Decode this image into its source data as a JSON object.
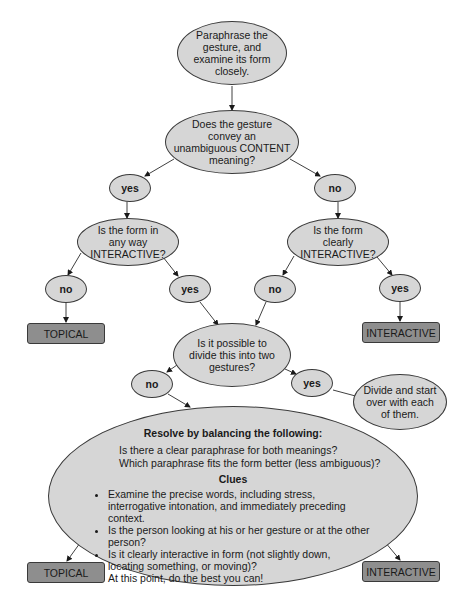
{
  "diagram": {
    "type": "decision-flowchart",
    "colors": {
      "ellipse_fill": "#d6d6d6",
      "outcome_fill": "#8e8e8e",
      "stroke": "#3a3a3a",
      "background": "#ffffff"
    },
    "nodes": {
      "start": {
        "lines": [
          "Paraphrase the",
          "gesture, and",
          "examine its form",
          "closely."
        ]
      },
      "q_content": {
        "lines": [
          "Does the gesture",
          "convey an",
          "unambiguous CONTENT",
          "meaning?"
        ]
      },
      "ans_yes_1": {
        "label": "yes"
      },
      "ans_no_1": {
        "label": "no"
      },
      "q_any_interactive": {
        "lines": [
          "Is the form in",
          "any way",
          "INTERACTIVE?"
        ]
      },
      "q_clearly_interactive": {
        "lines": [
          "Is the form",
          "clearly",
          "INTERACTIVE?"
        ]
      },
      "ans_no_2": {
        "label": "no"
      },
      "ans_yes_2": {
        "label": "yes"
      },
      "ans_no_3": {
        "label": "no"
      },
      "ans_yes_3": {
        "label": "yes"
      },
      "outcome_topical_1": {
        "label": "TOPICAL"
      },
      "outcome_interactive_1": {
        "label": "INTERACTIVE"
      },
      "q_divide": {
        "lines": [
          "Is it possible to",
          "divide this into two",
          "gestures?"
        ]
      },
      "ans_no_4": {
        "label": "no"
      },
      "ans_yes_4": {
        "label": "yes"
      },
      "divide_action": {
        "lines": [
          "Divide and start",
          "over with each",
          "of them."
        ]
      },
      "resolve": {
        "title": "Resolve by balancing the following:",
        "questions": [
          "Is there a clear paraphrase for both meanings?",
          "Which paraphrase fits the form better (less ambiguous)?"
        ],
        "clues_title": "Clues",
        "clues": [
          "Examine the precise words, including stress, interrogative intonation, and immediately preceding context.",
          "Is the person looking at his or her gesture or at the other person?",
          "Is it clearly interactive in form (not slightly down, locating something, or moving)?",
          "At this point, do the best you can!"
        ]
      },
      "outcome_topical_2": {
        "label": "TOPICAL"
      },
      "outcome_interactive_2": {
        "label": "INTERACTIVE"
      }
    },
    "edges": [
      [
        "start",
        "q_content"
      ],
      [
        "q_content",
        "ans_yes_1"
      ],
      [
        "q_content",
        "ans_no_1"
      ],
      [
        "ans_yes_1",
        "q_any_interactive"
      ],
      [
        "ans_no_1",
        "q_clearly_interactive"
      ],
      [
        "q_any_interactive",
        "ans_no_2"
      ],
      [
        "q_any_interactive",
        "ans_yes_2"
      ],
      [
        "q_clearly_interactive",
        "ans_no_3"
      ],
      [
        "q_clearly_interactive",
        "ans_yes_3"
      ],
      [
        "ans_no_2",
        "outcome_topical_1"
      ],
      [
        "ans_yes_3",
        "outcome_interactive_1"
      ],
      [
        "ans_yes_2",
        "q_divide"
      ],
      [
        "ans_no_3",
        "q_divide"
      ],
      [
        "q_divide",
        "ans_no_4"
      ],
      [
        "q_divide",
        "ans_yes_4"
      ],
      [
        "ans_yes_4",
        "divide_action"
      ],
      [
        "ans_no_4",
        "resolve"
      ],
      [
        "resolve",
        "outcome_topical_2"
      ],
      [
        "resolve",
        "outcome_interactive_2"
      ]
    ]
  }
}
